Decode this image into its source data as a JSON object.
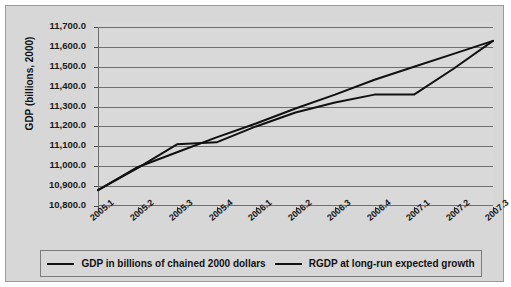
{
  "figure": {
    "background_color": "#d7d7d7",
    "plot_background_color": "#d9d9d9",
    "line_color": "#111111",
    "grid_color": "#6f6f6f"
  },
  "clipped_caption_artifact": "· · ·",
  "legend": {
    "items": [
      {
        "label": "GDP in billions of chained 2000 dollars",
        "color": "#111111"
      },
      {
        "label": "RGDP at long-run expected growth",
        "color": "#111111"
      }
    ]
  },
  "chart_data": {
    "type": "line",
    "title": "",
    "xlabel": "",
    "ylabel": "GDP (billions, 2000)",
    "grid": true,
    "legend_position": "bottom",
    "ylim": [
      10800,
      11700
    ],
    "yticks": [
      10800,
      10900,
      11000,
      11100,
      11200,
      11300,
      11400,
      11500,
      11600,
      11700
    ],
    "ytick_labels": [
      "10,800.0",
      "10,900.0",
      "11,000.0",
      "11,100.0",
      "11,200.0",
      "11,300.0",
      "11,400.0",
      "11,500.0",
      "11,600.0",
      "11,700.0"
    ],
    "categories": [
      "2005.1",
      "2005.2",
      "2005.3",
      "2005.4",
      "2006.1",
      "2006.2",
      "2006.3",
      "2006.4",
      "2007.1",
      "2007.2",
      "2007.3"
    ],
    "series": [
      {
        "name": "GDP in billions of chained 2000 dollars",
        "values": [
          10880,
          10990,
          11110,
          11120,
          11200,
          11270,
          11320,
          11360,
          11360,
          11490,
          11630
        ]
      },
      {
        "name": "RGDP at long-run expected growth",
        "values": [
          10880,
          10995,
          11070,
          11145,
          11215,
          11290,
          11360,
          11435,
          11500,
          11565,
          11630
        ]
      }
    ]
  }
}
